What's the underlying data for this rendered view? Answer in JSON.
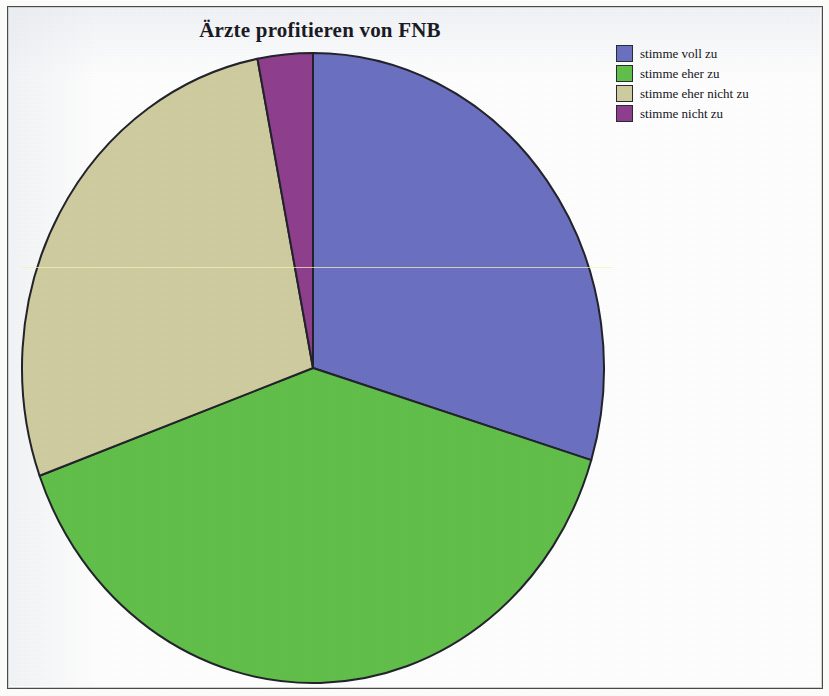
{
  "chart_data": {
    "type": "pie",
    "title": "Ärzte profitieren von FNB",
    "xlabel": "",
    "ylabel": "",
    "legend_position": "right",
    "grid": false,
    "categories": [
      "stimme voll zu",
      "stimme eher zu",
      "stimme eher nicht zu",
      "stimme nicht zu"
    ],
    "values": [
      29.7,
      39.7,
      27.5,
      3.1
    ],
    "start_angle_deg": 0,
    "direction": "clockwise",
    "slices": [
      {
        "label": "stimme voll zu",
        "value": 29.7,
        "color": "#6b71c0",
        "start_deg": 0,
        "end_deg": 107
      },
      {
        "label": "stimme eher zu",
        "value": 39.7,
        "color": "#62bf4a",
        "start_deg": 107,
        "end_deg": 250
      },
      {
        "label": "stimme eher nicht zu",
        "value": 27.5,
        "color": "#cfcca0",
        "start_deg": 250,
        "end_deg": 349
      },
      {
        "label": "stimme nicht zu",
        "value": 3.1,
        "color": "#8e3f8d",
        "start_deg": 349,
        "end_deg": 360
      }
    ],
    "slice_outline_color": "#23232c",
    "background_color": "#fefefe"
  },
  "legend": {
    "items": [
      {
        "label": "stimme voll zu",
        "color": "#6b71c0"
      },
      {
        "label": "stimme eher zu",
        "color": "#62bf4a"
      },
      {
        "label": "stimme eher nicht zu",
        "color": "#cfcca0"
      },
      {
        "label": "stimme nicht zu",
        "color": "#8e3f8d"
      }
    ]
  },
  "geometry": {
    "center_x": 313,
    "center_y": 368,
    "radius_x": 291,
    "radius_y": 315
  }
}
